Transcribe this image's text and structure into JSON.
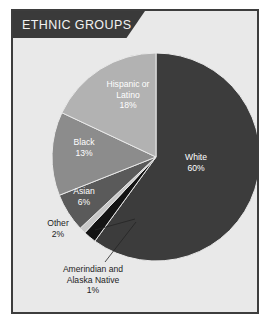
{
  "panel": {
    "title": "ETHNIC GROUPS",
    "background_color": "#e9e9e9",
    "border_color": "#3d3d3d",
    "banner_color": "#3a3a3a"
  },
  "chart_data": {
    "type": "pie",
    "title": "ETHNIC GROUPS",
    "xlabel": "",
    "ylabel": "",
    "legend_position": "none",
    "grid": false,
    "units": "percent",
    "start_angle_deg": 0,
    "direction": "clockwise",
    "categories": [
      "White",
      "Other",
      "Amerindian and Alaska Native",
      "Asian",
      "Black",
      "Hispanic or Latino"
    ],
    "values": [
      60,
      2,
      1,
      6,
      13,
      18
    ],
    "colors": [
      "#3c3c3c",
      "#141414",
      "#c8c8c8",
      "#5a5a5a",
      "#8c8c8c",
      "#b2b2b2"
    ],
    "slices": [
      {
        "name": "White",
        "label": "White",
        "value": 60,
        "value_label": "60%",
        "color": "#3c3c3c",
        "label_placement": "inside"
      },
      {
        "name": "Other",
        "label": "Other",
        "value": 2,
        "value_label": "2%",
        "color": "#141414",
        "label_placement": "callout"
      },
      {
        "name": "Amerindian and Alaska Native",
        "label": "Amerindian and\nAlaska Native",
        "label_line_1": "Amerindian and",
        "label_line_2": "Alaska Native",
        "value": 1,
        "value_label": "1%",
        "color": "#c8c8c8",
        "label_placement": "callout"
      },
      {
        "name": "Asian",
        "label": "Asian",
        "value": 6,
        "value_label": "6%",
        "color": "#5a5a5a",
        "label_placement": "inside"
      },
      {
        "name": "Black",
        "label": "Black",
        "value": 13,
        "value_label": "13%",
        "color": "#8c8c8c",
        "label_placement": "inside"
      },
      {
        "name": "Hispanic or Latino",
        "label": "Hispanic or\nLatino",
        "label_line_1": "Hispanic or",
        "label_line_2": "Latino",
        "value": 18,
        "value_label": "18%",
        "color": "#b2b2b2",
        "label_placement": "inside"
      }
    ]
  }
}
